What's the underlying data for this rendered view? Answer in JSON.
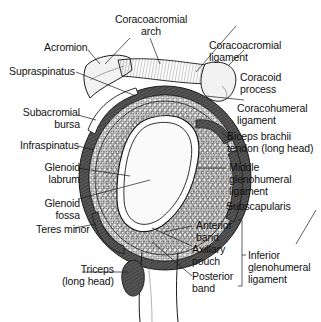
{
  "figure": {
    "labels": {
      "coracoacromial_arch": [
        "Coracoacromial",
        "arch"
      ],
      "acromion": "Acromion",
      "coracoacromial_ligament": [
        "Coracoacromial",
        "ligament"
      ],
      "supraspinatus": "Supraspinatus",
      "coracoid_process": [
        "Coracoid",
        "process"
      ],
      "subacromial_bursa": [
        "Subacromial",
        "bursa"
      ],
      "coracohumeral_ligament": [
        "Coracohumeral",
        "ligament"
      ],
      "infraspinatus": "Infraspinatus",
      "biceps_tendon": [
        "Biceps brachii",
        "tendon (long head)"
      ],
      "glenoid_labrum": [
        "Glenoid",
        "labrum"
      ],
      "middle_gh_ligament": [
        "Middle",
        "glenohumeral",
        "ligament"
      ],
      "glenoid_fossa": [
        "Glenoid",
        "fossa"
      ],
      "subscapularis": "Subscapularis",
      "teres_minor": "Teres minor",
      "anterior_band": [
        "Anterior",
        "band"
      ],
      "axillary_pouch": [
        "Axillary",
        "pouch"
      ],
      "posterior_band": [
        "Posterior",
        "band"
      ],
      "inferior_gh_ligament": [
        "Inferior",
        "glenohumeral",
        "ligament"
      ],
      "triceps": [
        "Triceps",
        "(long head)"
      ]
    },
    "colors": {
      "line": "#1a1a1a",
      "muscle_dark": "#4a4a4a",
      "muscle_mid": "#7a7a7a",
      "bone_fill": "#f4f4f4",
      "fossa_fill": "#ffffff"
    }
  }
}
